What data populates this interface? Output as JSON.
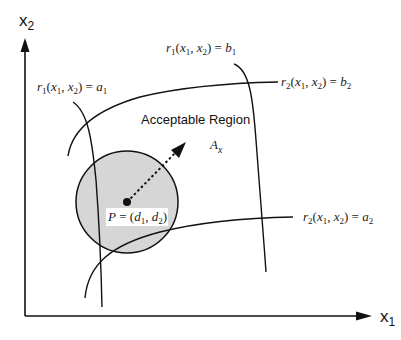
{
  "diagram": {
    "axes": {
      "x_label": "x",
      "x_sub": "1",
      "y_label": "x",
      "y_sub": "2"
    },
    "region_label": "Acceptable Region",
    "region_symbol": "A",
    "region_symbol_sub": "x",
    "point_label": "P = (d1, d2)",
    "constraints": {
      "r1_a1": "r1(x1, x2) = a1",
      "r1_b1": "r1(x1, x2) = b1",
      "r2_a2": "r2(x1, x2) = a2",
      "r2_b2": "r2(x1, x2) = b2"
    },
    "colors": {
      "line": "#111111",
      "circle_fill": "#d6d6d6",
      "background": "#ffffff"
    }
  }
}
